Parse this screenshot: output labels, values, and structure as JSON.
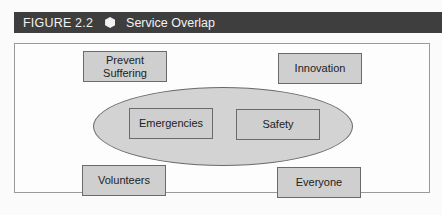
{
  "header": {
    "figure_label": "FIGURE 2.2",
    "icon": "hexagon-icon",
    "title": "Service Overlap"
  },
  "diagram": {
    "outer_boxes": {
      "top_left": "Prevent Suffering",
      "top_right": "Innovation",
      "bottom_left": "Volunteers",
      "bottom_right": "Everyone"
    },
    "overlap_ellipse": {
      "left_box": "Emergencies",
      "right_box": "Safety"
    }
  },
  "colors": {
    "header_bg": "#3e3e3e",
    "box_fill": "#cfcfcf",
    "ellipse_fill": "#d3d3d3"
  }
}
